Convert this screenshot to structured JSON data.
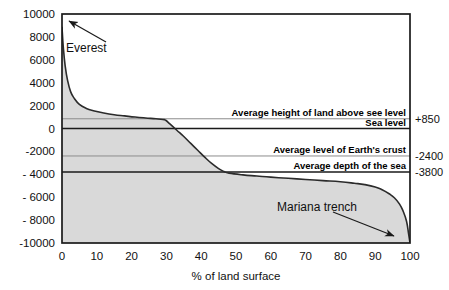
{
  "chart_data": {
    "type": "area",
    "title": "",
    "xlabel": "% of land surface",
    "ylabel": "",
    "xlim": [
      0,
      100
    ],
    "ylim": [
      -10000,
      10000
    ],
    "grid": false,
    "legend_position": "none",
    "x_ticks": [
      "0",
      "10",
      "20",
      "30",
      "40",
      "50",
      "60",
      "70",
      "80",
      "90",
      "100"
    ],
    "x_tick_values": [
      0,
      10,
      20,
      30,
      40,
      50,
      60,
      70,
      80,
      90,
      100
    ],
    "y_ticks": [
      "10000",
      "8000",
      "6000",
      "4000",
      "2000",
      "0",
      "-2000",
      "- 4000",
      "- 6000",
      "- 8000",
      "-10000"
    ],
    "y_tick_values": [
      10000,
      8000,
      6000,
      4000,
      2000,
      0,
      -2000,
      -4000,
      -6000,
      -8000,
      -10000
    ],
    "series": [
      {
        "name": "Hypsometric curve",
        "x": [
          0,
          0.4,
          0.9,
          1.6,
          2.5,
          3.6,
          5,
          7,
          9,
          12,
          15,
          18,
          21,
          24,
          27,
          29,
          29.8,
          31,
          33,
          35,
          37,
          39,
          41,
          43,
          45,
          46.5,
          48,
          52,
          56,
          60,
          65,
          70,
          75,
          80,
          84,
          87,
          90,
          92,
          94,
          95.5,
          97,
          98,
          99,
          99.6,
          100
        ],
        "y": [
          8848,
          7000,
          5500,
          4200,
          3200,
          2600,
          2100,
          1750,
          1550,
          1350,
          1200,
          1100,
          1000,
          920,
          850,
          790,
          720,
          400,
          -150,
          -700,
          -1300,
          -1900,
          -2500,
          -3050,
          -3500,
          -3750,
          -3900,
          -4050,
          -4150,
          -4250,
          -4350,
          -4450,
          -4550,
          -4650,
          -4780,
          -4900,
          -5100,
          -5350,
          -5700,
          -6050,
          -6600,
          -7200,
          -8100,
          -9200,
          -10000
        ]
      }
    ],
    "reference_lines": [
      {
        "id": "avg-land-height",
        "label": "Average height of land above see level",
        "value": 850,
        "value_label": "+850",
        "weight": "thin"
      },
      {
        "id": "sea-level",
        "label": "Sea level",
        "value": 0,
        "value_label": "",
        "weight": "thick"
      },
      {
        "id": "avg-crust-level",
        "label": "Average level of Earth's crust",
        "value": -2400,
        "value_label": "-2400",
        "weight": "thin"
      },
      {
        "id": "avg-sea-depth",
        "label": "Average depth of the sea",
        "value": -3800,
        "value_label": "-3800",
        "weight": "thick"
      }
    ],
    "annotations": [
      {
        "id": "everest",
        "label": "Everest",
        "points_to_x": 0,
        "points_to_y": 8848
      },
      {
        "id": "mariana-trench",
        "label": "Mariana trench",
        "points_to_x": 99.4,
        "points_to_y": -9300
      }
    ],
    "colors": {
      "fill": "#d9d9d9",
      "curve": "#2b2b2b",
      "axis": "#1a1a1a",
      "thin_rule": "#8c8c8c",
      "background": "#ffffff"
    }
  }
}
